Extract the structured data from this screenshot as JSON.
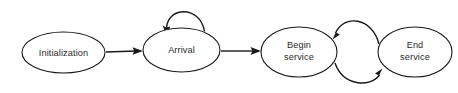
{
  "diagram": {
    "background_color": "#ffffff",
    "stroke_color": "#1a1a1a",
    "text_color": "#2b2b2b",
    "nodes": [
      {
        "id": "initialization",
        "label": "Initialization",
        "lines": [
          "Initialization"
        ],
        "cx": 63.5,
        "cy": 52.5,
        "rx": 41.5,
        "ry": 20.5
      },
      {
        "id": "arrival",
        "label": "Arrival",
        "lines": [
          "Arrival"
        ],
        "cx": 181.5,
        "cy": 50.0,
        "rx": 38.5,
        "ry": 22.0
      },
      {
        "id": "begin-service",
        "label": "Begin service",
        "lines": [
          "Begin",
          "service"
        ],
        "cx": 299.0,
        "cy": 52.0,
        "rx": 38.0,
        "ry": 25.0
      },
      {
        "id": "end-service",
        "label": "End service",
        "lines": [
          "End",
          "service"
        ],
        "cx": 415.0,
        "cy": 52.0,
        "rx": 37.0,
        "ry": 25.0
      }
    ],
    "edges": [
      {
        "id": "initialization-to-arrival",
        "from": "initialization",
        "to": "arrival",
        "style": "straight",
        "label": ""
      },
      {
        "id": "arrival-self-loop",
        "from": "arrival",
        "to": "arrival",
        "style": "self-loop-top",
        "label": ""
      },
      {
        "id": "arrival-to-begin-service",
        "from": "arrival",
        "to": "begin-service",
        "style": "straight",
        "label": ""
      },
      {
        "id": "end-service-to-begin-service",
        "from": "end-service",
        "to": "begin-service",
        "style": "curve-top",
        "label": ""
      },
      {
        "id": "begin-service-to-end-service",
        "from": "begin-service",
        "to": "end-service",
        "style": "curve-bottom",
        "label": ""
      }
    ]
  }
}
